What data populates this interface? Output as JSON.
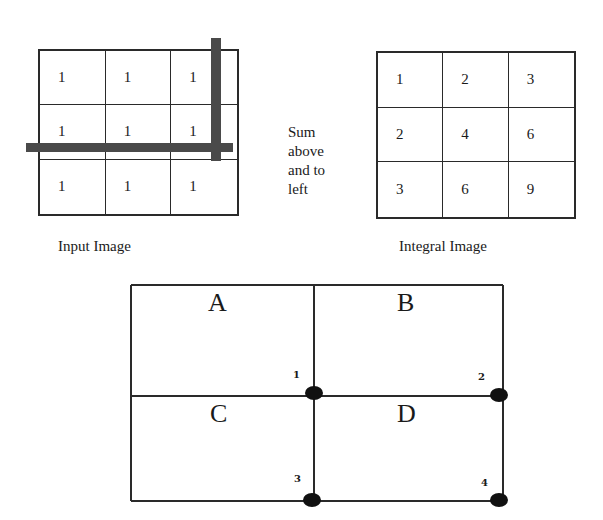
{
  "input_image": {
    "caption": "Input Image",
    "cells": [
      "1",
      "1",
      "1",
      "1",
      "1",
      "1",
      "1",
      "1",
      "1"
    ]
  },
  "sidenote": {
    "lines": [
      "Sum",
      "above",
      "and to",
      "left"
    ]
  },
  "integral_image": {
    "caption": "Integral Image",
    "cells": [
      "1",
      "2",
      "3",
      "2",
      "4",
      "6",
      "3",
      "6",
      "9"
    ]
  },
  "regions": {
    "labels": [
      "A",
      "B",
      "C",
      "D"
    ],
    "corner_points": [
      "1",
      "2",
      "3",
      "4"
    ]
  },
  "colors": {
    "line": "#2a2a2a",
    "highlight_bar": "#4a4a4a",
    "dot": "#111111"
  }
}
